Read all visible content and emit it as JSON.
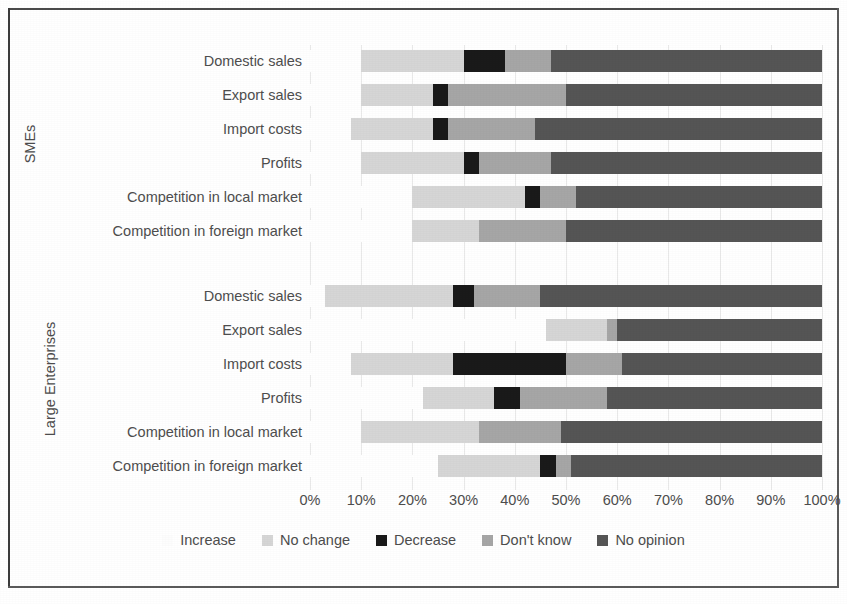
{
  "chart_data": {
    "type": "bar",
    "subtype": "stacked-horizontal-100percent",
    "title": "",
    "xlabel": "",
    "ylabel": "",
    "xlim": [
      0,
      100
    ],
    "xticks": [
      "0%",
      "10%",
      "20%",
      "30%",
      "40%",
      "50%",
      "60%",
      "70%",
      "80%",
      "90%",
      "100%"
    ],
    "grid": true,
    "legend_position": "bottom",
    "series": [
      {
        "name": "Increase",
        "color": "#ffffff"
      },
      {
        "name": "No change",
        "color": "#d6d6d6"
      },
      {
        "name": "Decrease",
        "color": "#1a1a1a"
      },
      {
        "name": "Don't know",
        "color": "#a6a6a6"
      },
      {
        "name": "No opinion",
        "color": "#555555"
      }
    ],
    "groups": [
      {
        "name": "SMEs",
        "categories": [
          "Domestic sales",
          "Export sales",
          "Import costs",
          "Profits",
          "Competition in local market",
          "Competition in foreign market"
        ],
        "values": [
          [
            10,
            20,
            8,
            9,
            53
          ],
          [
            10,
            14,
            3,
            23,
            50
          ],
          [
            8,
            16,
            3,
            17,
            56
          ],
          [
            10,
            20,
            3,
            14,
            53
          ],
          [
            20,
            22,
            3,
            7,
            48
          ],
          [
            20,
            13,
            0,
            17,
            50
          ]
        ]
      },
      {
        "name": "Large Enterprises",
        "categories": [
          "Domestic sales",
          "Export sales",
          "Import costs",
          "Profits",
          "Competition in local market",
          "Competition in foreign market"
        ],
        "values": [
          [
            3,
            25,
            4,
            13,
            55
          ],
          [
            46,
            12,
            0,
            2,
            40
          ],
          [
            8,
            20,
            22,
            11,
            39
          ],
          [
            22,
            14,
            5,
            17,
            42
          ],
          [
            10,
            23,
            0,
            16,
            51
          ],
          [
            25,
            20,
            3,
            3,
            49
          ]
        ]
      }
    ]
  },
  "legend": {
    "items": [
      {
        "label": "Increase"
      },
      {
        "label": "No change"
      },
      {
        "label": "Decrease"
      },
      {
        "label": "Don't know"
      },
      {
        "label": "No opinion"
      }
    ]
  }
}
